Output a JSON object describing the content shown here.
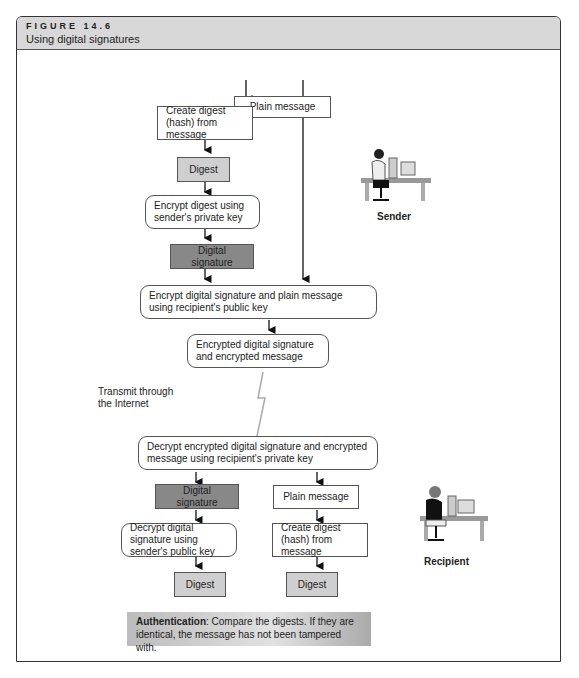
{
  "figure": {
    "number": "FIGURE 14.6",
    "title": "Using digital signatures"
  },
  "sender": {
    "label": "Sender",
    "boxes": {
      "plain_message": "Plain message",
      "create_digest": "Create digest (hash) from message",
      "digest": "Digest",
      "encrypt_digest": "Encrypt digest using sender's private key",
      "digital_signature": "Digital signature",
      "encrypt_both": "Encrypt digital signature and plain message using recipient's public key",
      "encrypted_result": "Encrypted digital signature and encrypted message"
    }
  },
  "transmit": {
    "label": "Transmit through the Internet"
  },
  "recipient": {
    "label": "Recipient",
    "boxes": {
      "decrypt_both": "Decrypt encrypted digital signature and encrypted message using recipient's private key",
      "digital_signature": "Digital signature",
      "plain_message": "Plain message",
      "decrypt_signature": "Decrypt digital signature using sender's public key",
      "create_digest": "Create digest (hash) from message",
      "digest_left": "Digest",
      "digest_right": "Digest"
    }
  },
  "authentication": {
    "bold": "Authentication",
    "text": ": Compare the digests. If they are identical, the message has not been tampered with."
  },
  "colors": {
    "light_box": "#cfcfcf",
    "dark_box": "#888888",
    "header": "#d8d8d8"
  }
}
